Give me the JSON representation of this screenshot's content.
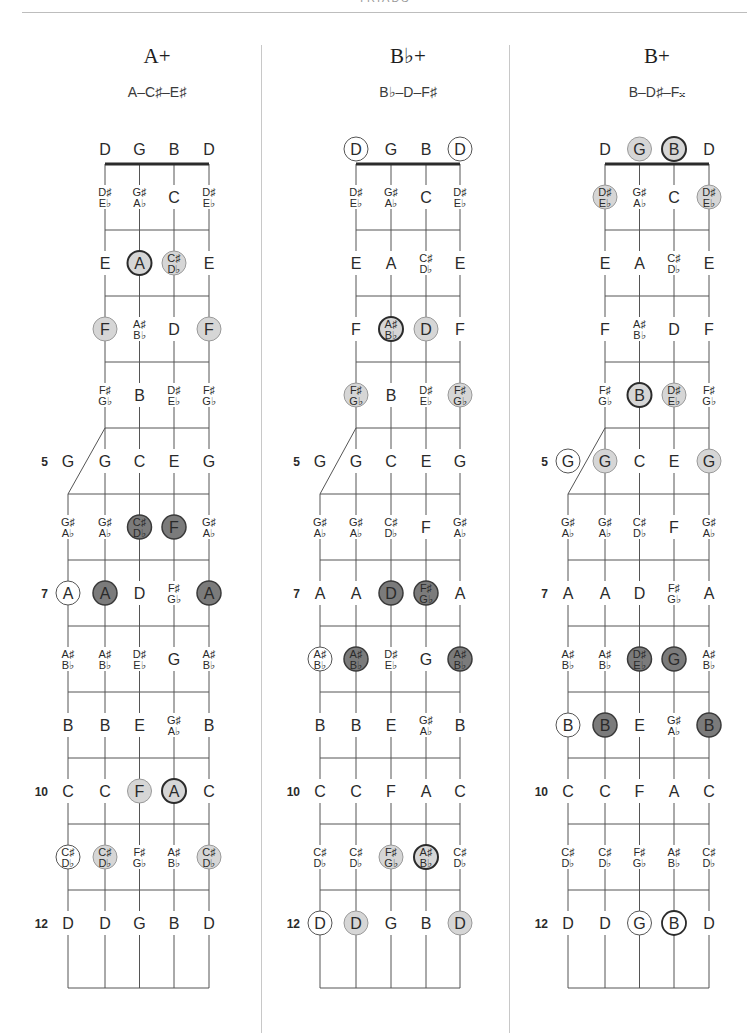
{
  "page": {
    "header_title": "TRIADS"
  },
  "colors": {
    "line": "#555555",
    "nut": "#2b2b2b",
    "light_fill": "#d6d6d6",
    "dark_fill": "#7b7b7b",
    "open_fill": "#ffffff",
    "outline_thin": "#8a8a8a",
    "outline_bold": "#2b2b2b"
  },
  "open_strings": [
    "D",
    "G",
    "B",
    "D"
  ],
  "fret_markers": [
    "5",
    "7",
    "10",
    "12"
  ],
  "fret_rows": [
    [
      "D♯/E♭",
      "G♯/A♭",
      "C",
      "D♯/E♭"
    ],
    [
      "E",
      "A",
      "C♯/D♭",
      "E"
    ],
    [
      "F",
      "A♯/B♭",
      "D",
      "F"
    ],
    [
      "F♯/G♭",
      "B",
      "D♯/E♭",
      "F♯/G♭"
    ],
    [
      "G",
      "G",
      "C",
      "E",
      "G"
    ],
    [
      "G♯/A♭",
      "G♯/A♭",
      "C♯/D♭",
      "F",
      "G♯/A♭"
    ],
    [
      "A",
      "A",
      "D",
      "F♯/G♭",
      "A"
    ],
    [
      "A♯/B♭",
      "A♯/B♭",
      "D♯/E♭",
      "G",
      "A♯/B♭"
    ],
    [
      "B",
      "B",
      "E",
      "G♯/A♭",
      "B"
    ],
    [
      "C",
      "C",
      "F",
      "A",
      "C"
    ],
    [
      "C♯/D♭",
      "C♯/D♭",
      "F♯/G♭",
      "A♯/B♭",
      "C♯/D♭"
    ],
    [
      "D",
      "D",
      "G",
      "B",
      "D"
    ]
  ],
  "chords": [
    {
      "title": "A+",
      "notes": "A–C♯–E♯",
      "highlights": [
        {
          "fret": 2,
          "col": 1,
          "style": "light-bold"
        },
        {
          "fret": 2,
          "col": 2,
          "style": "light"
        },
        {
          "fret": 3,
          "col": 0,
          "style": "light"
        },
        {
          "fret": 3,
          "col": 3,
          "style": "light"
        },
        {
          "fret": 6,
          "col": 2,
          "style": "dark"
        },
        {
          "fret": 6,
          "col": 3,
          "style": "dark"
        },
        {
          "fret": 7,
          "col": 0,
          "style": "open"
        },
        {
          "fret": 7,
          "col": 1,
          "style": "dark"
        },
        {
          "fret": 7,
          "col": 4,
          "style": "dark"
        },
        {
          "fret": 10,
          "col": 2,
          "style": "light"
        },
        {
          "fret": 10,
          "col": 3,
          "style": "light-bold"
        },
        {
          "fret": 11,
          "col": 0,
          "style": "open"
        },
        {
          "fret": 11,
          "col": 1,
          "style": "light"
        },
        {
          "fret": 11,
          "col": 4,
          "style": "light"
        }
      ]
    },
    {
      "title": "B♭+",
      "notes": "B♭–D–F♯",
      "highlights": [
        {
          "fret": 0,
          "col": 0,
          "style": "open"
        },
        {
          "fret": 0,
          "col": 3,
          "style": "open"
        },
        {
          "fret": 3,
          "col": 1,
          "style": "light-bold"
        },
        {
          "fret": 3,
          "col": 2,
          "style": "light"
        },
        {
          "fret": 4,
          "col": 0,
          "style": "light"
        },
        {
          "fret": 4,
          "col": 3,
          "style": "light"
        },
        {
          "fret": 7,
          "col": 2,
          "style": "dark"
        },
        {
          "fret": 7,
          "col": 3,
          "style": "dark"
        },
        {
          "fret": 8,
          "col": 0,
          "style": "open"
        },
        {
          "fret": 8,
          "col": 1,
          "style": "dark"
        },
        {
          "fret": 8,
          "col": 4,
          "style": "dark"
        },
        {
          "fret": 11,
          "col": 2,
          "style": "light"
        },
        {
          "fret": 11,
          "col": 3,
          "style": "light-bold"
        },
        {
          "fret": 12,
          "col": 0,
          "style": "open"
        },
        {
          "fret": 12,
          "col": 1,
          "style": "light"
        },
        {
          "fret": 12,
          "col": 4,
          "style": "light"
        }
      ]
    },
    {
      "title": "B+",
      "notes": "B–D♯–F𝄪",
      "highlights": [
        {
          "fret": 0,
          "col": 1,
          "style": "light"
        },
        {
          "fret": 0,
          "col": 2,
          "style": "light-bold"
        },
        {
          "fret": 1,
          "col": 0,
          "style": "light"
        },
        {
          "fret": 1,
          "col": 3,
          "style": "light"
        },
        {
          "fret": 4,
          "col": 1,
          "style": "light-bold"
        },
        {
          "fret": 4,
          "col": 2,
          "style": "light"
        },
        {
          "fret": 5,
          "col": 0,
          "style": "open"
        },
        {
          "fret": 5,
          "col": 1,
          "style": "light"
        },
        {
          "fret": 5,
          "col": 4,
          "style": "light"
        },
        {
          "fret": 8,
          "col": 2,
          "style": "dark"
        },
        {
          "fret": 8,
          "col": 3,
          "style": "dark"
        },
        {
          "fret": 9,
          "col": 0,
          "style": "open"
        },
        {
          "fret": 9,
          "col": 1,
          "style": "dark"
        },
        {
          "fret": 9,
          "col": 4,
          "style": "dark"
        },
        {
          "fret": 12,
          "col": 2,
          "style": "open"
        },
        {
          "fret": 12,
          "col": 3,
          "style": "open-bold"
        }
      ]
    }
  ]
}
